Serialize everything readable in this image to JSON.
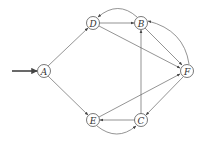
{
  "diagram": {
    "type": "directed-graph",
    "start_node": "A",
    "nodes": [
      {
        "id": "A",
        "label": "A",
        "x": 44,
        "y": 71
      },
      {
        "id": "D",
        "label": "D",
        "x": 93,
        "y": 23
      },
      {
        "id": "B",
        "label": "B",
        "x": 141,
        "y": 23
      },
      {
        "id": "F",
        "label": "F",
        "x": 187,
        "y": 71
      },
      {
        "id": "E",
        "label": "E",
        "x": 93,
        "y": 120
      },
      {
        "id": "C",
        "label": "C",
        "x": 141,
        "y": 120
      }
    ],
    "edges": [
      {
        "from": "A",
        "to": "D"
      },
      {
        "from": "A",
        "to": "E"
      },
      {
        "from": "D",
        "to": "B"
      },
      {
        "from": "B",
        "to": "D",
        "curved": true
      },
      {
        "from": "D",
        "to": "F"
      },
      {
        "from": "B",
        "to": "F"
      },
      {
        "from": "F",
        "to": "B",
        "curved": true
      },
      {
        "from": "C",
        "to": "B"
      },
      {
        "from": "E",
        "to": "F"
      },
      {
        "from": "F",
        "to": "C"
      },
      {
        "from": "C",
        "to": "E"
      },
      {
        "from": "E",
        "to": "C",
        "curved": true
      }
    ]
  }
}
